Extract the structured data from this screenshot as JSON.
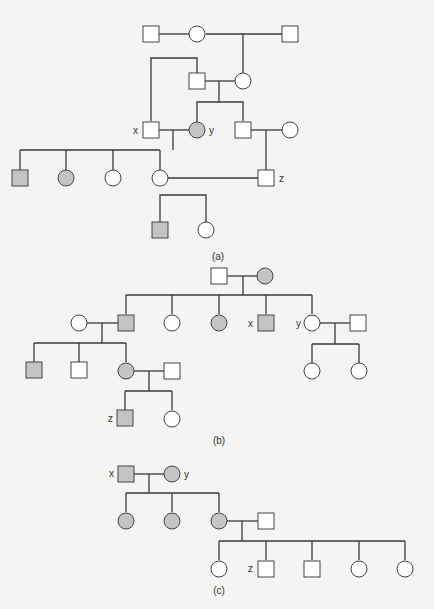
{
  "figure": {
    "panels": [
      {
        "id": "a",
        "caption": "(a)"
      },
      {
        "id": "b",
        "caption": "(b)"
      },
      {
        "id": "c",
        "caption": "(c)"
      }
    ],
    "labels": {
      "x": "x",
      "y": "y",
      "z": "z"
    },
    "legend_semantics": {
      "square": "male",
      "circle": "female",
      "shaded": "affected",
      "unshaded": "unaffected"
    },
    "colors": {
      "affected_fill": "#c4c4c4",
      "unaffected_fill": "#ffffff",
      "stroke": "#444444",
      "background": "#f4f4f2"
    }
  },
  "pedigree_a": {
    "gen1": [
      "male unaffected",
      "female unaffected",
      "male unaffected"
    ],
    "gen2": [
      "male unaffected",
      "female unaffected"
    ],
    "gen3": [
      "male unaffected (x)",
      "female affected (y)",
      "male unaffected",
      "female unaffected"
    ],
    "gen4": [
      "male affected",
      "female affected",
      "female unaffected",
      "female unaffected",
      "male unaffected (z)"
    ],
    "gen5": [
      "male affected",
      "female unaffected"
    ]
  },
  "pedigree_b": {
    "gen1": [
      "male unaffected",
      "female affected"
    ],
    "gen2": [
      "female unaffected (spouse)",
      "male affected",
      "female unaffected",
      "female affected",
      "male affected (x)",
      "female unaffected (y)",
      "male unaffected (spouse)"
    ],
    "gen3": [
      "male affected",
      "male unaffected",
      "female affected",
      "male unaffected (spouse)",
      "female unaffected",
      "female unaffected"
    ],
    "gen4": [
      "male affected (z)",
      "female unaffected"
    ]
  },
  "pedigree_c": {
    "gen1": [
      "male affected (x)",
      "female affected (y)"
    ],
    "gen2": [
      "female affected",
      "female affected",
      "female affected",
      "male unaffected (spouse)"
    ],
    "gen3": [
      "female unaffected",
      "male unaffected (z)",
      "male unaffected",
      "female unaffected",
      "female unaffected"
    ]
  }
}
